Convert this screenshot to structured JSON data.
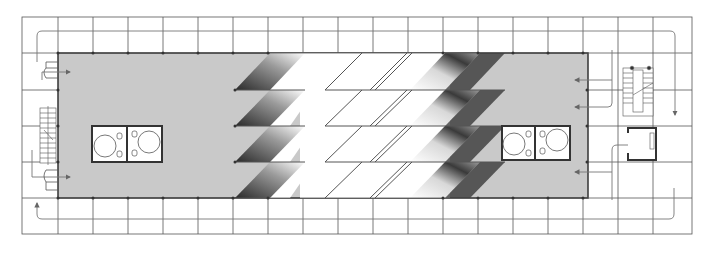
{
  "colors": {
    "floor_fill": "#c9c9c9",
    "grid_line": "#555555",
    "wall": "#333333",
    "void": "#ffffff",
    "arrow": "#666666"
  },
  "grid": {
    "columns_x": [
      22,
      58,
      93,
      128,
      163,
      198,
      233,
      268,
      303,
      338,
      373,
      408,
      443,
      478,
      513,
      548,
      583,
      618,
      653,
      692
    ],
    "rows_y": [
      17,
      53,
      90,
      126,
      162,
      198,
      234
    ]
  },
  "floor_area": {
    "x": 58,
    "y": 53,
    "w": 530,
    "h": 145
  },
  "cores": [
    {
      "name": "left-core-restrooms",
      "x": 92,
      "y": 126,
      "w": 70,
      "h": 36
    },
    {
      "name": "right-core-restrooms",
      "x": 500,
      "y": 126,
      "w": 70,
      "h": 36
    }
  ],
  "stairs": [
    {
      "name": "left-stair",
      "x": 40,
      "y": 108,
      "w": 16,
      "h": 55
    },
    {
      "name": "right-stair",
      "x": 622,
      "y": 68,
      "w": 30,
      "h": 48
    }
  ],
  "elevator": {
    "name": "right-elevator",
    "x": 625,
    "y": 127,
    "w": 36,
    "h": 34
  }
}
